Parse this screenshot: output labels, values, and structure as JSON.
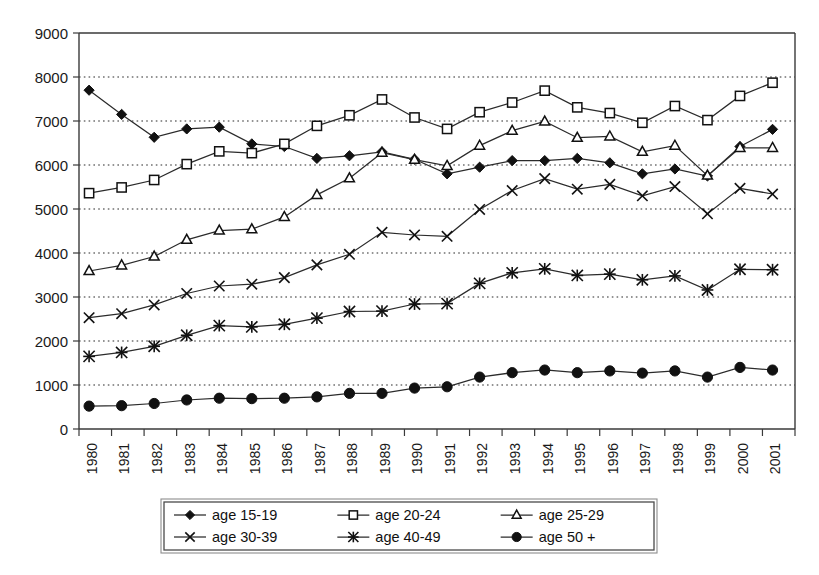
{
  "chart_data": {
    "type": "line",
    "title": "",
    "subtitle": "",
    "xlabel": "",
    "ylabel": "",
    "xlim": [
      1980,
      2001
    ],
    "ylim": [
      0,
      9000
    ],
    "y_tick_step": 1000,
    "grid": true,
    "grid_axis": "y",
    "legend_position": "bottom",
    "legend_columns": 3,
    "categories": [
      "1980",
      "1981",
      "1982",
      "1983",
      "1984",
      "1985",
      "1986",
      "1987",
      "1988",
      "1989",
      "1990",
      "1991",
      "1992",
      "1993",
      "1994",
      "1995",
      "1996",
      "1997",
      "1998",
      "1999",
      "2000",
      "2001"
    ],
    "y_tick_labels": [
      "0",
      "1000",
      "2000",
      "3000",
      "4000",
      "5000",
      "6000",
      "7000",
      "8000",
      "9000"
    ],
    "series": [
      {
        "name": "age 15-19",
        "marker": "filled-diamond",
        "values": [
          7700,
          7150,
          6630,
          6820,
          6860,
          6480,
          6420,
          6150,
          6210,
          6300,
          6130,
          5800,
          5950,
          6100,
          6100,
          6150,
          6050,
          5800,
          5910,
          5750,
          6420,
          6810
        ]
      },
      {
        "name": "age 20-24",
        "marker": "open-square",
        "values": [
          5360,
          5490,
          5660,
          6020,
          6310,
          6270,
          6480,
          6890,
          7130,
          7490,
          7080,
          6820,
          7200,
          7420,
          7690,
          7310,
          7180,
          6960,
          7340,
          7020,
          7570,
          7870
        ]
      },
      {
        "name": "age 25-29",
        "marker": "open-triangle",
        "values": [
          3590,
          3720,
          3920,
          4300,
          4510,
          4540,
          4820,
          5320,
          5700,
          6280,
          6120,
          5980,
          6440,
          6780,
          6990,
          6620,
          6650,
          6300,
          6440,
          5760,
          6390,
          6390
        ]
      },
      {
        "name": "age 30-39",
        "marker": "cross",
        "values": [
          2530,
          2620,
          2820,
          3080,
          3250,
          3290,
          3440,
          3730,
          3970,
          4470,
          4410,
          4380,
          4990,
          5420,
          5690,
          5450,
          5560,
          5300,
          5510,
          4890,
          5470,
          5340
        ]
      },
      {
        "name": "age 40-49",
        "marker": "asterisk",
        "values": [
          1650,
          1740,
          1880,
          2130,
          2350,
          2320,
          2380,
          2520,
          2670,
          2680,
          2840,
          2850,
          3310,
          3550,
          3640,
          3490,
          3520,
          3390,
          3480,
          3160,
          3630,
          3620
        ]
      },
      {
        "name": "age 50 +",
        "marker": "filled-circle",
        "values": [
          520,
          530,
          580,
          660,
          700,
          690,
          700,
          730,
          810,
          810,
          930,
          960,
          1180,
          1280,
          1340,
          1280,
          1320,
          1270,
          1320,
          1180,
          1400,
          1340
        ]
      }
    ]
  },
  "legend": {
    "items": [
      {
        "label": "age 15-19",
        "marker": "filled-diamond"
      },
      {
        "label": "age 20-24",
        "marker": "open-square"
      },
      {
        "label": "age 25-29",
        "marker": "open-triangle"
      },
      {
        "label": "age 30-39",
        "marker": "cross"
      },
      {
        "label": "age 40-49",
        "marker": "asterisk"
      },
      {
        "label": "age 50 +",
        "marker": "filled-circle"
      }
    ]
  },
  "colors": {
    "ink": "#111111",
    "axis": "#3a3a3a",
    "grid": "#2b2b2b",
    "background": "#ffffff"
  }
}
